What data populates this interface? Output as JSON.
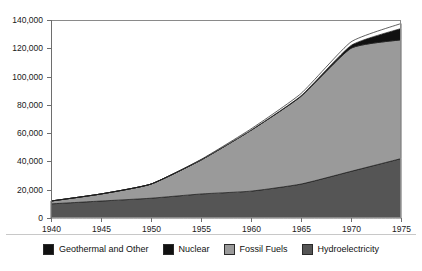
{
  "chart_data": {
    "type": "area",
    "stacked": true,
    "title": "",
    "subtitle": "",
    "xlabel": "",
    "ylabel": "",
    "xlim": [
      1940,
      1975
    ],
    "ylim": [
      0,
      140000
    ],
    "xticks": [
      1940,
      1945,
      1950,
      1955,
      1960,
      1965,
      1970,
      1975
    ],
    "xtick_labels": [
      "1940",
      "1945",
      "1950",
      "1955",
      "1960",
      "1965",
      "1970",
      "1975"
    ],
    "yticks": [
      0,
      20000,
      40000,
      60000,
      80000,
      100000,
      120000,
      140000
    ],
    "ytick_labels": [
      "0",
      "20,000",
      "40,000",
      "60,000",
      "80,000",
      "100,000",
      "120,000",
      "140,000"
    ],
    "grid": false,
    "legend_position": "bottom",
    "x": [
      1940,
      1945,
      1950,
      1955,
      1960,
      1965,
      1970,
      1975
    ],
    "series": [
      {
        "name": "Hydroelectricity",
        "color": "#555555",
        "values": [
          10000,
          12000,
          14000,
          17000,
          19000,
          24000,
          33000,
          42000
        ]
      },
      {
        "name": "Fossil Fuels",
        "color": "#9a9a9a",
        "values": [
          2000,
          5000,
          10000,
          24000,
          43000,
          62000,
          87000,
          84000
        ]
      },
      {
        "name": "Nuclear",
        "color": "#111111",
        "values": [
          0,
          0,
          0,
          0,
          100,
          400,
          2000,
          8000
        ]
      },
      {
        "name": "Geothermal and Other",
        "color": "#ffffff",
        "values": [
          0,
          0,
          0,
          400,
          900,
          1600,
          2500,
          3500
        ]
      }
    ],
    "stack_order_bottom_to_top": [
      "Hydroelectricity",
      "Fossil Fuels",
      "Nuclear",
      "Geothermal and Other"
    ],
    "totals": [
      12000,
      17000,
      24000,
      41400,
      63000,
      88000,
      124500,
      137500
    ]
  },
  "legend": {
    "entries": [
      {
        "label": "Geothermal and Other",
        "color": "#111111"
      },
      {
        "label": "Nuclear",
        "color": "#111111"
      },
      {
        "label": "Fossil Fuels",
        "color": "#9a9a9a"
      },
      {
        "label": "Hydroelectricity",
        "color": "#555555"
      }
    ]
  },
  "colors": {
    "hydro": "#555555",
    "fossil": "#9a9a9a",
    "nuclear": "#111111",
    "geothermal": "#ffffff",
    "axis": "#6e6e6e",
    "frame": "#8a8a8a",
    "text": "#1a1a1a",
    "background": "#ffffff"
  }
}
